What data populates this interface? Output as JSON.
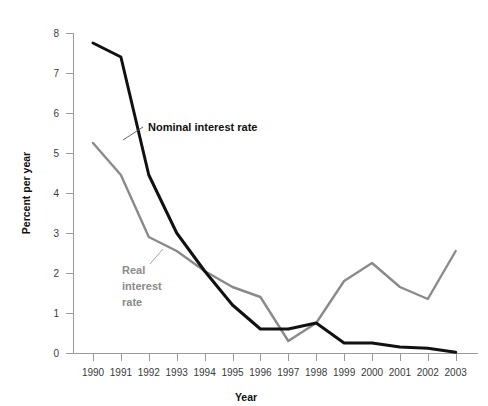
{
  "chart_data": {
    "type": "line",
    "title": "",
    "xlabel": "Year",
    "ylabel": "Percent per year",
    "categories": [
      "1990",
      "1991",
      "1992",
      "1993",
      "1994",
      "1995",
      "1996",
      "1997",
      "1998",
      "1999",
      "2000",
      "2001",
      "2002",
      "2003"
    ],
    "x": [
      1990,
      1991,
      1992,
      1993,
      1994,
      1995,
      1996,
      1997,
      1998,
      1999,
      2000,
      2001,
      2002,
      2003
    ],
    "xlim": [
      1990,
      2003
    ],
    "ylim": [
      0,
      8
    ],
    "ytick_labels": [
      "0",
      "1",
      "2",
      "3",
      "4",
      "5",
      "6",
      "7",
      "8"
    ],
    "yticks": [
      0,
      1,
      2,
      3,
      4,
      5,
      6,
      7,
      8
    ],
    "grid": false,
    "legend_position": "inline-annotations",
    "series": [
      {
        "name": "Nominal interest rate",
        "color": "#111111",
        "values": [
          7.75,
          7.4,
          4.45,
          3.0,
          2.05,
          1.2,
          0.6,
          0.6,
          0.75,
          0.25,
          0.25,
          0.15,
          0.12,
          0.02
        ]
      },
      {
        "name": "Real interest rate",
        "color": "#8a8a8a",
        "values": [
          5.25,
          4.45,
          2.9,
          2.55,
          2.05,
          1.65,
          1.4,
          0.3,
          0.75,
          1.8,
          2.25,
          1.65,
          1.35,
          2.55
        ]
      }
    ],
    "annotations": [
      {
        "text": "Nominal interest rate",
        "series": "Nominal interest rate",
        "color": "#111111"
      },
      {
        "text": "Real interest rate",
        "series": "Real interest rate",
        "color": "#8a8a8a"
      }
    ]
  },
  "labels": {
    "nominal_line1": "Nominal interest rate",
    "real_line1": "Real",
    "real_line2": "interest",
    "real_line3": "rate",
    "x_axis_title": "Year",
    "y_axis_title": "Percent per year"
  },
  "colors": {
    "nominal": "#111111",
    "real": "#8a8a8a",
    "axis": "#9a9a9a",
    "text": "#3a3a3a"
  }
}
